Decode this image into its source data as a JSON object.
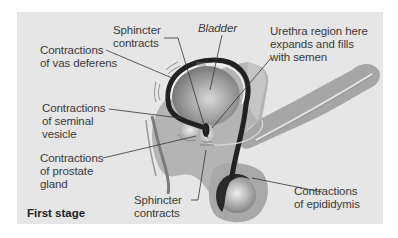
{
  "figure": {
    "stage_label": "First stage",
    "colors": {
      "panel_background": "#e6e6e6",
      "tissue": "#b8b8b8",
      "tissue_dark": "#9a9a9a",
      "duct": "#2a2a2a",
      "organ": "#8c8c8c",
      "leader_line": "#333333",
      "text": "#3a3a3a"
    },
    "labels": [
      {
        "id": "sphincter-top",
        "text": "Sphincter\ncontracts"
      },
      {
        "id": "bladder",
        "text": "Bladder"
      },
      {
        "id": "urethra-region",
        "text": "Urethra region here\nexpands and fills\nwith semen"
      },
      {
        "id": "vas-deferens",
        "text": "Contractions\nof vas deferens"
      },
      {
        "id": "seminal-vesicle",
        "text": "Contractions\nof seminal\nvesicle"
      },
      {
        "id": "prostate-gland",
        "text": "Contractions\nof prostate\ngland"
      },
      {
        "id": "sphincter-bottom",
        "text": "Sphincter\ncontracts"
      },
      {
        "id": "epididymis",
        "text": "Contractions\nof epididymis"
      }
    ]
  }
}
